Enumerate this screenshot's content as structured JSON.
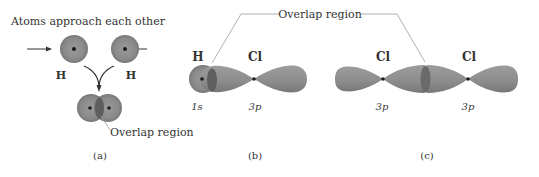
{
  "figure": {
    "panel_a": {
      "title": "Atoms approach each other",
      "atom_left_label": "H",
      "atom_right_label": "H",
      "overlap_label": "Overlap region",
      "caption": "(a)"
    },
    "panel_b": {
      "atom1_label": "H",
      "atom2_label": "Cl",
      "orbital1_label": "1s",
      "orbital2_label": "3p",
      "caption": "(b)"
    },
    "panel_c": {
      "atom1_label": "Cl",
      "atom2_label": "Cl",
      "orbital1_label": "3p",
      "orbital2_label": "3p",
      "caption": "(c)"
    },
    "shared_overlap_label": "Overlap region",
    "colors": {
      "orbital_fill": "#8c8c8c",
      "orbital_dark": "#6e6e6e",
      "overlap_fill": "#5c5c5c",
      "nucleus": "#1a1a1a",
      "line": "#9a9a9a",
      "text": "#333333"
    }
  }
}
